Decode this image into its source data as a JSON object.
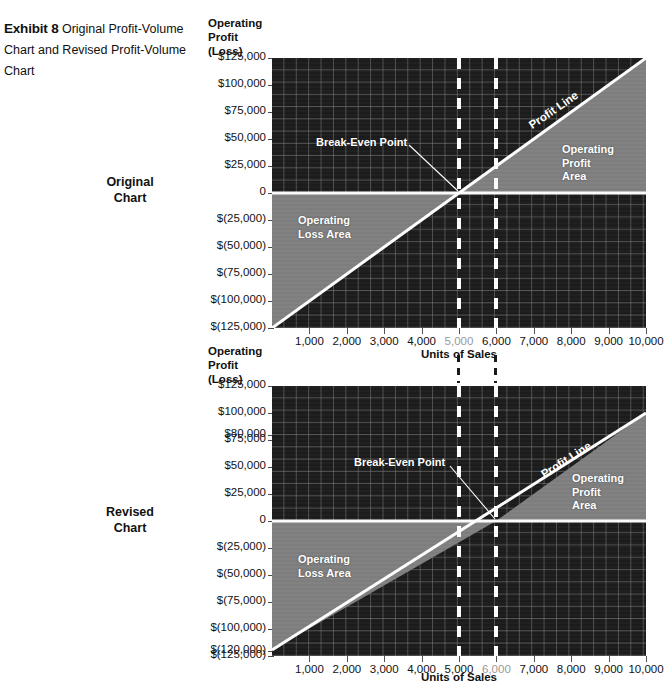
{
  "exhibit": {
    "label": "Exhibit 8",
    "caption": "Original Profit-Volume Chart and Revised Profit-Volume Chart"
  },
  "side_labels": {
    "original": "Original\nChart",
    "revised": "Revised\nChart"
  },
  "colors": {
    "plot_background": "#1c1c1c",
    "grid_line": "#7d7d7d",
    "shaded_area": "#808080",
    "boundary_line": "#ffffff",
    "text": "#111111",
    "muted_tick": "#9a9a9a"
  },
  "chart_data": [
    {
      "id": "original-chart",
      "type": "line",
      "title": "Original Chart",
      "ylabel": "Operating Profit\n(Loss)",
      "xlabel": "Units of Sales",
      "xlim": [
        0,
        10000
      ],
      "ylim": [
        -125000,
        125000
      ],
      "grid": true,
      "x_ticks": [
        1000,
        2000,
        3000,
        4000,
        5000,
        6000,
        7000,
        8000,
        9000,
        10000
      ],
      "x_tick_labels": [
        "1,000",
        "2,000",
        "3,000",
        "4,000",
        "5,000",
        "6,000",
        "7,000",
        "8,000",
        "9,000",
        "10,000"
      ],
      "x_tick_highlight": "5,000",
      "y_ticks": [
        125000,
        100000,
        75000,
        50000,
        25000,
        0,
        -25000,
        -50000,
        -75000,
        -100000,
        -125000
      ],
      "y_tick_labels": [
        "$125,000",
        "$100,000",
        "$75,000",
        "$50,000",
        "$25,000",
        "0",
        "$(25,000)",
        "$(50,000)",
        "$(75,000)",
        "$(100,000)",
        "$(125,000)"
      ],
      "series": [
        {
          "name": "Profit Line",
          "x": [
            0,
            10000
          ],
          "y": [
            -125000,
            125000
          ]
        }
      ],
      "break_even_units": 5000,
      "break_even_value": 0,
      "annotations": [
        {
          "name": "break-even-point",
          "text": "Break-Even Point"
        },
        {
          "name": "profit-line",
          "text": "Profit Line"
        },
        {
          "name": "operating-profit-area",
          "text": "Operating\nProfit\nArea"
        },
        {
          "name": "operating-loss-area",
          "text": "Operating\nLoss Area"
        }
      ],
      "reference_lines": [
        {
          "name": "ref-line-5000",
          "x": 5000,
          "style": "dashed",
          "color": "#ffffff"
        },
        {
          "name": "ref-line-6000",
          "x": 6000,
          "style": "dashed",
          "color": "#ffffff"
        }
      ]
    },
    {
      "id": "revised-chart",
      "type": "line",
      "title": "Revised Chart",
      "ylabel": "Operating Profit\n(Loss)",
      "xlabel": "Units of Sales",
      "xlim": [
        0,
        10000
      ],
      "ylim": [
        -125000,
        125000
      ],
      "grid": true,
      "x_ticks": [
        1000,
        2000,
        3000,
        4000,
        5000,
        6000,
        7000,
        8000,
        9000,
        10000
      ],
      "x_tick_labels": [
        "1,000",
        "2,000",
        "3,000",
        "4,000",
        "5,000",
        "6,000",
        "7,000",
        "8,000",
        "9,000",
        "10,000"
      ],
      "x_tick_highlight": "6,000",
      "y_ticks": [
        125000,
        100000,
        80000,
        75000,
        50000,
        25000,
        0,
        -25000,
        -50000,
        -75000,
        -100000,
        -120000,
        -125000
      ],
      "y_tick_labels": [
        "$125,000",
        "$100,000",
        "$80,000",
        "$75,000",
        "$50,000",
        "$25,000",
        "0",
        "$(25,000)",
        "$(50,000)",
        "$(75,000)",
        "$(100,000)",
        "$(120,000)",
        "$(125,000)"
      ],
      "series": [
        {
          "name": "Profit Line",
          "x": [
            0,
            10000
          ],
          "y": [
            -120000,
            80000
          ]
        }
      ],
      "break_even_units": 6000,
      "break_even_value": 0,
      "annotations": [
        {
          "name": "break-even-point",
          "text": "Break-Even Point"
        },
        {
          "name": "profit-line",
          "text": "Profit Line"
        },
        {
          "name": "operating-profit-area",
          "text": "Operating\nProfit\nArea"
        },
        {
          "name": "operating-loss-area",
          "text": "Operating\nLoss Area"
        }
      ],
      "reference_lines": [
        {
          "name": "ref-line-5000",
          "x": 5000,
          "style": "dashed",
          "color": "#ffffff"
        },
        {
          "name": "ref-line-6000",
          "x": 6000,
          "style": "dashed",
          "color": "#ffffff"
        }
      ]
    }
  ]
}
